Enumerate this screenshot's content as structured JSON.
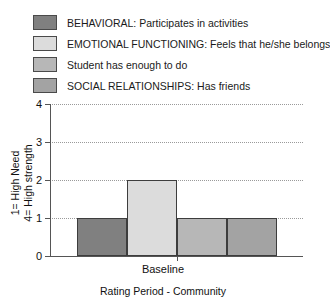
{
  "chart_data": {
    "type": "bar",
    "title": "",
    "subtitle": "",
    "xlabel": "Rating Period - Community",
    "ylabel_lines": [
      "1= High Need",
      "4= High strength"
    ],
    "categories": [
      "Baseline"
    ],
    "xticklabels": [
      "Baseline"
    ],
    "yticklabels": [
      "0",
      "1",
      "2",
      "3",
      "4"
    ],
    "ytickvalues": [
      0,
      1,
      2,
      3,
      4
    ],
    "ylim": [
      0,
      4
    ],
    "grid": "horizontal-dotted",
    "legend_position": "above-plot-left",
    "series": [
      {
        "name": "BEHAVIORAL: Participates in activities",
        "color": "#808080",
        "values": [
          1
        ]
      },
      {
        "name": "EMOTIONAL FUNCTIONING: Feels that he/she belongs",
        "color": "#dcdcdc",
        "values": [
          2
        ]
      },
      {
        "name": "Student has enough to do",
        "color": "#b7b7b7",
        "values": [
          1
        ]
      },
      {
        "name": "SOCIAL RELATIONSHIPS: Has friends",
        "color": "#a3a3a3",
        "values": [
          1
        ]
      }
    ]
  },
  "legend": {
    "items": [
      {
        "label": "BEHAVIORAL: Participates in activities",
        "color": "#808080"
      },
      {
        "label": "EMOTIONAL FUNCTIONING: Feels that he/she belongs",
        "color": "#dcdcdc"
      },
      {
        "label": "Student has enough to do",
        "color": "#b7b7b7"
      },
      {
        "label": "SOCIAL RELATIONSHIPS: Has friends",
        "color": "#a3a3a3"
      }
    ]
  },
  "axes": {
    "y_title_line_1": "1= High Need",
    "y_title_line_2": "4= High strength",
    "y_ticks": [
      "4",
      "3",
      "2",
      "1",
      "0"
    ],
    "x_tick": "Baseline",
    "x_title": "Rating Period - Community"
  },
  "colors": {
    "axis": "#555555",
    "grid": "#9a9a9a",
    "bar_border": "#3d3d3d",
    "text": "#111111",
    "background": "#ffffff"
  }
}
